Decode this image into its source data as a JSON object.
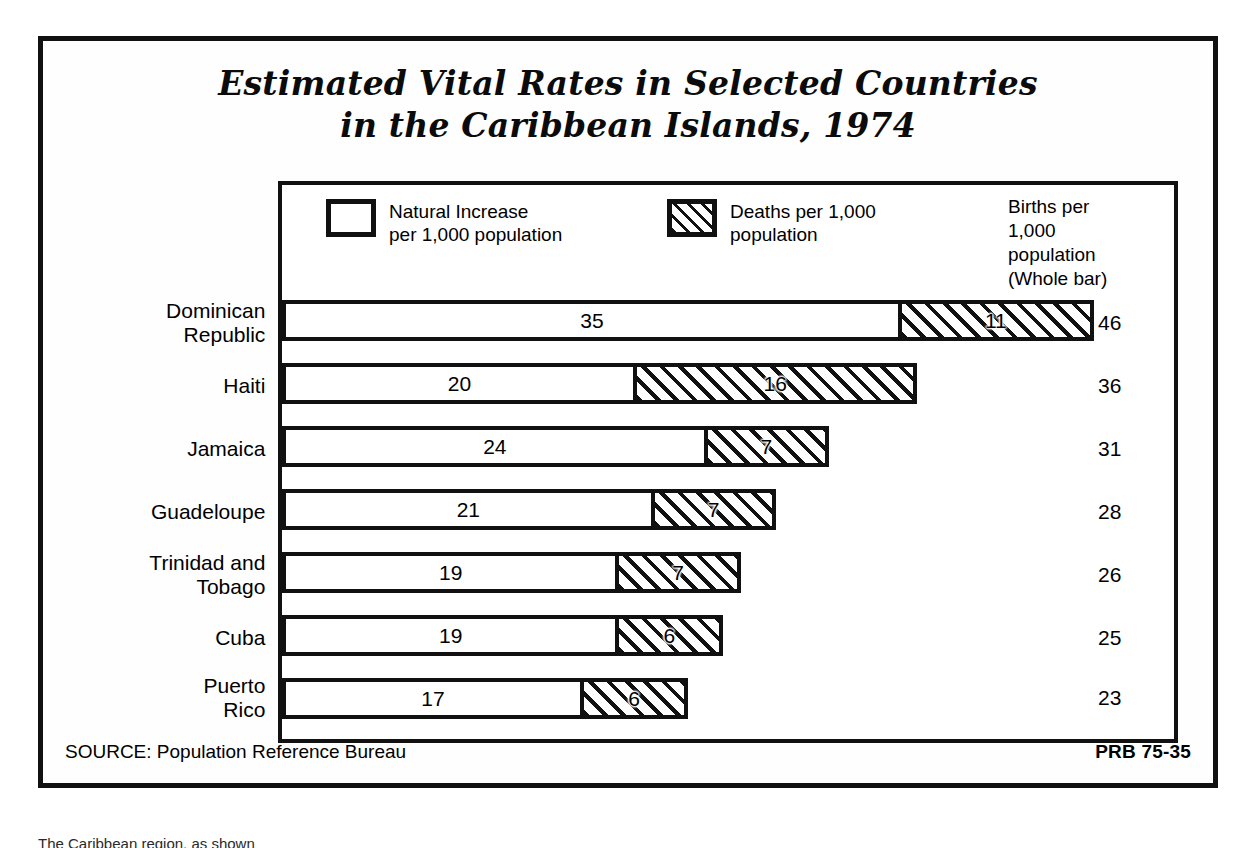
{
  "title": {
    "line1": "Estimated Vital Rates in Selected Countries",
    "line2": "in the Caribbean Islands, 1974"
  },
  "legend": {
    "natural_label": "Natural Increase\nper 1,000 population",
    "deaths_label": "Deaths per 1,000\npopulation",
    "births_label": "Births per\n1,000\npopulation\n(Whole bar)"
  },
  "footer": {
    "source": "SOURCE: Population Reference Bureau",
    "code": "PRB 75-35"
  },
  "caption": "The Caribbean region, as shown",
  "colors": {
    "ink": "#111111",
    "paper": "#ffffff"
  },
  "chart_data": {
    "type": "bar",
    "orientation": "horizontal",
    "stacked": true,
    "title": "Estimated Vital Rates in Selected Countries in the Caribbean Islands, 1974",
    "xlabel": "",
    "ylabel": "",
    "xlim": [
      0,
      46
    ],
    "grid": false,
    "legend_position": "top",
    "categories": [
      "Dominican\nRepublic",
      "Haiti",
      "Jamaica",
      "Guadeloupe",
      "Trinidad and\nTobago",
      "Cuba",
      "Puerto\nRico"
    ],
    "series": [
      {
        "name": "Natural Increase per 1,000 population",
        "values": [
          35,
          20,
          24,
          21,
          19,
          19,
          17
        ]
      },
      {
        "name": "Deaths per 1,000 population",
        "values": [
          11,
          16,
          7,
          7,
          7,
          6,
          6
        ]
      }
    ],
    "totals": {
      "name": "Births per 1,000 population (Whole bar)",
      "values": [
        46,
        36,
        31,
        28,
        26,
        25,
        23
      ]
    }
  }
}
